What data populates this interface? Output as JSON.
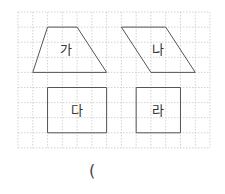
{
  "grid": {
    "x0": 18,
    "y0": 12,
    "cols": 13,
    "rows": 9,
    "cell_w": 14.77,
    "cell_h": 15.1,
    "line_color": "#c8c8c8"
  },
  "shapes": [
    {
      "id": "ga",
      "label": "가",
      "kind": "trapezoid",
      "points_grid": [
        [
          2,
          1
        ],
        [
          4,
          1
        ],
        [
          6,
          4
        ],
        [
          1,
          4
        ]
      ]
    },
    {
      "id": "na",
      "label": "나",
      "kind": "parallelogram",
      "points_grid": [
        [
          7,
          1
        ],
        [
          10,
          1
        ],
        [
          12,
          4
        ],
        [
          9,
          4
        ]
      ]
    },
    {
      "id": "da",
      "label": "다",
      "kind": "rectangle",
      "points_grid": [
        [
          2,
          5
        ],
        [
          6,
          5
        ],
        [
          6,
          8
        ],
        [
          2,
          8
        ]
      ]
    },
    {
      "id": "ra",
      "label": "라",
      "kind": "rectangle",
      "points_grid": [
        [
          8,
          5
        ],
        [
          11,
          5
        ],
        [
          11,
          8
        ],
        [
          8,
          8
        ]
      ]
    }
  ],
  "labels": {
    "ga": "가",
    "na": "나",
    "da": "다",
    "ra": "라"
  },
  "answer_blank": {
    "open_paren": "("
  },
  "colors": {
    "shape_stroke": "#555555",
    "label_text": "#333333"
  }
}
